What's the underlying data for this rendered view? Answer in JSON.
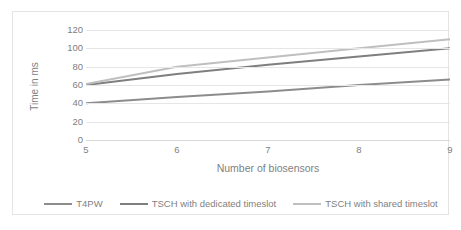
{
  "chart_data": {
    "type": "line",
    "title": "",
    "xlabel": "Number of biosensors",
    "ylabel": "Time in ms",
    "x": [
      5,
      6,
      7,
      8,
      9
    ],
    "xticklabels": [
      "5",
      "6",
      "7",
      "8",
      "9"
    ],
    "yticklabels": [
      "0",
      "20",
      "40",
      "60",
      "80",
      "100",
      "120"
    ],
    "yticks": [
      0,
      20,
      40,
      60,
      80,
      100,
      120
    ],
    "xlim": [
      5,
      9
    ],
    "ylim": [
      0,
      120
    ],
    "grid": "horizontal",
    "legend_position": "bottom",
    "series": [
      {
        "name": "T4PW",
        "color": "#8c8c8c",
        "values": [
          40,
          47,
          53,
          60,
          66
        ]
      },
      {
        "name": "TSCH with dedicated timeslot",
        "color": "#7f7f7f",
        "values": [
          60,
          72,
          82,
          91,
          100
        ]
      },
      {
        "name": "TSCH with shared timeslot",
        "color": "#bfbfbf",
        "values": [
          61,
          80,
          90,
          100,
          110
        ]
      }
    ]
  },
  "legend": {
    "items": [
      {
        "label": "T4PW",
        "color": "#8c8c8c"
      },
      {
        "label": "TSCH with dedicated timeslot",
        "color": "#7f7f7f"
      },
      {
        "label": "TSCH with shared timeslot",
        "color": "#bfbfbf"
      }
    ]
  },
  "axes": {
    "y_title": "Time in ms",
    "x_title": "Number of biosensors",
    "y_ticks": [
      "120",
      "100",
      "80",
      "60",
      "40",
      "20",
      "0"
    ],
    "x_ticks": [
      "5",
      "6",
      "7",
      "8",
      "9"
    ]
  },
  "colors": {
    "grid": "#e6e6e6",
    "border": "#e4e4e4",
    "tick_text": "#808080",
    "axis_title": "#7f7f7f",
    "background": "#ffffff"
  }
}
